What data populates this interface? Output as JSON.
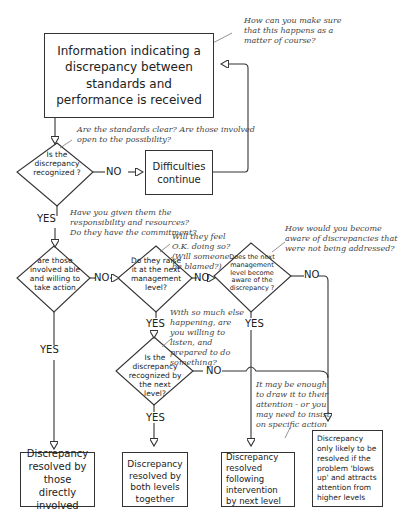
{
  "start": {
    "label": "Information indicating a discrepancy between standards and performance is received"
  },
  "notes": {
    "top_right": "How can you make sure that this happens as a matter of course?",
    "standards": "Are the standards clear? Are those involved open to the possibility?",
    "responsibility": "Have you given them the responsibility and resources? Do they have the commitment?",
    "feel_ok": "Will they feel O.K. doing so? (Will someone be blamed?)",
    "aware": "How would you become aware of discrepancies that were not being addressed?",
    "listen": "With so much else happening, are you willing to listen, and prepared to do something?",
    "insist": "It may be enough to draw it to their attention - or you may need to insist on specific action"
  },
  "decisions": {
    "d1": "Is the discrepancy recognized ?",
    "d2": "are those involved able and willing to take action",
    "d3": "Do they raise it at the next management level?",
    "d4": "Does the next management level become aware of the discrepancy ?",
    "d5": "Is the discrepancy recognized by the next level?"
  },
  "processes": {
    "difficulties": "Difficulties continue"
  },
  "outcomes": [
    "Discrepancy resolved by those directly involved",
    "Discrepancy resolved by both levels together",
    "Discrepancy resolved following intervention by next level",
    "Discrepancy only likely to be resolved if the problem 'blows up' and attracts attention from higher levels"
  ],
  "edge_labels": {
    "yes": "YES",
    "no": "NO"
  }
}
